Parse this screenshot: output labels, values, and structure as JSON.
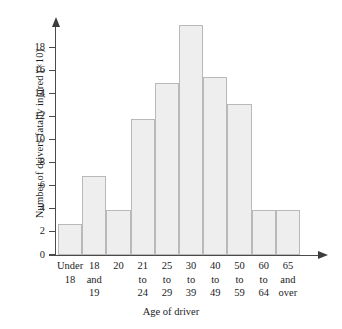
{
  "chart_data": {
    "type": "bar",
    "title": "",
    "xlabel": "Age of driver",
    "ylabel": "Number of drivers fatally injured (×10)",
    "categories": [
      "Under\n18",
      "18\nand\n19",
      "20",
      "21\nto\n24",
      "25\nto\n29",
      "30\nto\n39",
      "40\nto\n49",
      "50\nto\n59",
      "60\nto\n64",
      "65\nand\nover"
    ],
    "values": [
      2.7,
      6.8,
      3.9,
      11.8,
      14.9,
      19.9,
      15.4,
      13.1,
      3.9,
      3.9
    ],
    "ylim": [
      0,
      20
    ],
    "yticks": [
      0,
      2,
      4,
      6,
      8,
      10,
      12,
      14,
      16,
      18
    ],
    "ytick_labels": [
      "0",
      "2",
      "4",
      "6",
      "8",
      "10",
      "12",
      "14",
      "16",
      "18"
    ],
    "grid": false,
    "legend": null,
    "bar_fill_color": "#eeeeee",
    "bar_border_color": "#b9b9b9",
    "axis_color": "#4a4a4a"
  }
}
